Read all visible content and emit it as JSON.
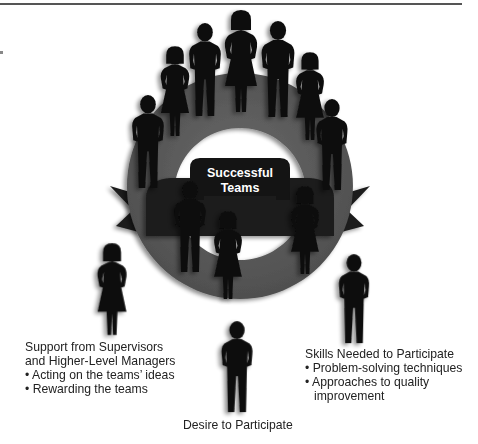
{
  "diagram": {
    "center_label": [
      "Successful",
      "Teams"
    ],
    "colors": {
      "ring": "#5a5a5a",
      "ribbon": "#1c1c1c",
      "figure": "#0d0d0d",
      "center_text": "#ffffff"
    },
    "factors": [
      {
        "title_lines": [
          "Support from Supervisors",
          "and Higher-Level Managers"
        ],
        "bullets": [
          "Acting on the teams’ ideas",
          "Rewarding the teams"
        ]
      },
      {
        "title_lines": [
          "Skills Needed to Participate"
        ],
        "bullets": [
          "Problem-solving techniques",
          "Approaches to quality"
        ],
        "bullet_continuation": "improvement"
      },
      {
        "title_lines": [
          "Desire to Participate"
        ],
        "bullets": []
      }
    ],
    "bullet_glyph": "•"
  }
}
